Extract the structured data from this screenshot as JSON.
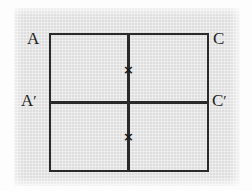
{
  "figure": {
    "background_color": "#e4e4e4",
    "line_color": "#2a2a2a",
    "labels": {
      "top_left": "A",
      "top_right": "C",
      "mid_left_base": "A",
      "mid_left_prime": "′",
      "mid_right_base": "C",
      "mid_right_prime": "′"
    },
    "markers": {
      "upper": "×",
      "lower": "×"
    }
  },
  "chart_data": {
    "type": "diagram",
    "title": "",
    "shapes": [
      {
        "name": "outer-rectangle",
        "kind": "rectangle",
        "x": 49,
        "y": 33,
        "width": 160,
        "height": 139
      },
      {
        "name": "divider-vertical",
        "kind": "line",
        "x1": 128,
        "y1": 33,
        "x2": 128,
        "y2": 172
      },
      {
        "name": "divider-horizontal",
        "kind": "line",
        "x1": 49,
        "y1": 102,
        "x2": 209,
        "y2": 102
      }
    ],
    "points": [
      {
        "name": "cross-upper",
        "label": "×",
        "x": 128,
        "y": 69
      },
      {
        "name": "cross-lower",
        "label": "×",
        "x": 128,
        "y": 136
      }
    ],
    "annotations": [
      {
        "name": "label-a",
        "text": "A",
        "x": 33,
        "y": 38
      },
      {
        "name": "label-c",
        "text": "C",
        "x": 219,
        "y": 38
      },
      {
        "name": "label-a-prime",
        "text": "A′",
        "x": 28,
        "y": 100
      },
      {
        "name": "label-c-prime",
        "text": "C′",
        "x": 219,
        "y": 100
      }
    ]
  }
}
